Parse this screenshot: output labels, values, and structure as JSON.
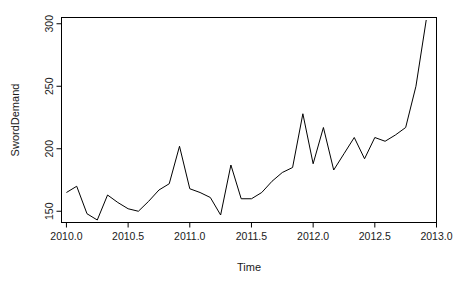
{
  "chart_data": {
    "type": "line",
    "title": "",
    "xlabel": "Time",
    "ylabel": "SwordDemand",
    "xlim": [
      2009.96,
      2013.0
    ],
    "ylim": [
      141,
      305
    ],
    "grid": false,
    "legend": null,
    "xticks": [
      2010.0,
      2010.5,
      2011.0,
      2011.5,
      2012.0,
      2012.5,
      2013.0
    ],
    "xtick_labels": [
      "2010.0",
      "2010.5",
      "2011.0",
      "2011.5",
      "2012.0",
      "2012.5",
      "2013.0"
    ],
    "yticks": [
      150,
      200,
      250,
      300
    ],
    "ytick_labels": [
      "150",
      "200",
      "250",
      "300"
    ],
    "series": [
      {
        "name": "SwordDemand",
        "color": "#000000",
        "x": [
          2010.0,
          2010.0833,
          2010.1667,
          2010.25,
          2010.3333,
          2010.4167,
          2010.5,
          2010.5833,
          2010.6667,
          2010.75,
          2010.8333,
          2010.9167,
          2011.0,
          2011.0833,
          2011.1667,
          2011.25,
          2011.3333,
          2011.4167,
          2011.5,
          2011.5833,
          2011.6667,
          2011.75,
          2011.8333,
          2011.9167,
          2012.0,
          2012.0833,
          2012.1667,
          2012.25,
          2012.3333,
          2012.4167,
          2012.5,
          2012.5833,
          2012.6667,
          2012.75,
          2012.8333,
          2012.9167
        ],
        "values": [
          165,
          170,
          148,
          143,
          163,
          157,
          152,
          150,
          158,
          167,
          172,
          202,
          168,
          165,
          161,
          147,
          187,
          160,
          160,
          165,
          174,
          181,
          185,
          228,
          188,
          217,
          183,
          196,
          209,
          192,
          209,
          206,
          211,
          217,
          250,
          303
        ]
      }
    ]
  },
  "axes": {
    "x_title": "Time",
    "y_title": "SwordDemand"
  }
}
